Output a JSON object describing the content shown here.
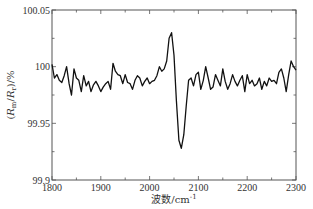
{
  "chart_data": {
    "type": "line",
    "title": "",
    "xlabel": "波数/cm⁻¹",
    "ylabel": "(R_m/R_r)/%",
    "xlim": [
      1800,
      2300
    ],
    "ylim": [
      99.9,
      100.05
    ],
    "x_ticks": [
      1800,
      1900,
      2000,
      2100,
      2200,
      2300
    ],
    "x_tick_labels": [
      "1800",
      "1900",
      "2000",
      "2100",
      "2200",
      "2300"
    ],
    "x_minor_step": 50,
    "y_ticks": [
      99.9,
      99.95,
      100,
      100.05
    ],
    "y_tick_labels": [
      "99.9",
      "99.95",
      "100",
      "100.05"
    ],
    "y_minor_step": 0.025,
    "grid": false,
    "legend": null,
    "series": [
      {
        "name": "reflectance ratio",
        "color": "#111111",
        "x": [
          1800,
          1805,
          1810,
          1815,
          1820,
          1825,
          1830,
          1835,
          1840,
          1845,
          1850,
          1855,
          1860,
          1865,
          1870,
          1875,
          1880,
          1885,
          1890,
          1895,
          1900,
          1905,
          1910,
          1915,
          1920,
          1925,
          1930,
          1935,
          1940,
          1945,
          1950,
          1955,
          1960,
          1965,
          1970,
          1975,
          1980,
          1985,
          1990,
          1995,
          2000,
          2005,
          2010,
          2015,
          2020,
          2025,
          2030,
          2035,
          2040,
          2045,
          2050,
          2055,
          2060,
          2065,
          2070,
          2075,
          2080,
          2085,
          2090,
          2095,
          2100,
          2105,
          2110,
          2115,
          2120,
          2125,
          2130,
          2135,
          2140,
          2145,
          2150,
          2155,
          2160,
          2165,
          2170,
          2175,
          2180,
          2185,
          2190,
          2195,
          2200,
          2205,
          2210,
          2215,
          2220,
          2225,
          2230,
          2235,
          2240,
          2245,
          2250,
          2255,
          2260,
          2265,
          2270,
          2275,
          2280,
          2285,
          2290,
          2295,
          2300
        ],
        "values": [
          100.002,
          99.99,
          99.993,
          99.988,
          99.986,
          99.992,
          100.0,
          99.985,
          99.975,
          99.998,
          99.99,
          99.988,
          99.978,
          99.992,
          99.983,
          99.987,
          99.978,
          99.984,
          99.987,
          99.983,
          99.978,
          99.982,
          99.985,
          99.987,
          99.98,
          100.003,
          99.996,
          99.993,
          99.992,
          99.985,
          99.993,
          99.986,
          99.985,
          99.98,
          99.988,
          99.992,
          99.99,
          99.983,
          99.987,
          99.99,
          99.985,
          99.987,
          99.988,
          99.992,
          100.0,
          99.996,
          99.998,
          100.005,
          100.025,
          100.03,
          100.01,
          99.97,
          99.935,
          99.928,
          99.94,
          99.965,
          99.988,
          99.99,
          99.983,
          99.993,
          99.995,
          99.98,
          99.988,
          100.0,
          99.99,
          99.98,
          99.982,
          99.993,
          99.988,
          99.983,
          99.998,
          99.987,
          99.98,
          99.985,
          99.993,
          99.987,
          99.983,
          99.988,
          99.992,
          99.978,
          99.993,
          99.985,
          99.988,
          99.983,
          99.985,
          99.99,
          99.98,
          99.987,
          99.983,
          99.99,
          99.987,
          99.988,
          99.985,
          99.995,
          99.998,
          99.99,
          99.978,
          99.993,
          100.005,
          100.0,
          99.997
        ]
      }
    ],
    "annotations": []
  },
  "axes": {
    "y_label_parts": {
      "open": "(",
      "num": "R",
      "num_sub": "m",
      "slash": "/",
      "den": "R",
      "den_sub": "r",
      "close": ")/%"
    },
    "x_label_text": "波数",
    "x_label_unit": "/cm",
    "x_label_exp": "-1"
  }
}
